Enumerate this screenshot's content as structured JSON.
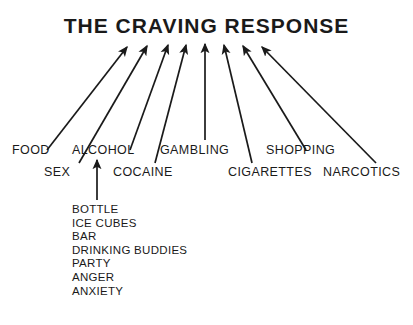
{
  "title": "THE CRAVING RESPONSE",
  "colors": {
    "ink": "#1a1a1a",
    "background": "#ffffff"
  },
  "diagram": {
    "type": "converging-arrow-fan",
    "convergence_point": {
      "x": 205,
      "y": 44
    }
  },
  "triggers": {
    "row_top": [
      {
        "label": "FOOD",
        "x": 12,
        "y": 143
      },
      {
        "label": "ALCOHOL",
        "x": 72,
        "y": 143
      },
      {
        "label": "GAMBLING",
        "x": 160,
        "y": 143
      },
      {
        "label": "SHOPPING",
        "x": 266,
        "y": 143
      }
    ],
    "row_bottom": [
      {
        "label": "SEX",
        "x": 44,
        "y": 165
      },
      {
        "label": "COCAINE",
        "x": 113,
        "y": 165
      },
      {
        "label": "CIGARETTES",
        "x": 228,
        "y": 165
      },
      {
        "label": "NARCOTICS",
        "x": 323,
        "y": 165
      }
    ]
  },
  "arrows": [
    {
      "name": "arrow-food",
      "x1": 47,
      "y1": 150,
      "x2": 127,
      "y2": 47
    },
    {
      "name": "arrow-sex",
      "x1": 79,
      "y1": 163,
      "x2": 147,
      "y2": 46
    },
    {
      "name": "arrow-alcohol",
      "x1": 130,
      "y1": 150,
      "x2": 168,
      "y2": 45
    },
    {
      "name": "arrow-cocaine",
      "x1": 155,
      "y1": 163,
      "x2": 186,
      "y2": 45
    },
    {
      "name": "arrow-gambling",
      "x1": 205,
      "y1": 140,
      "x2": 205,
      "y2": 44
    },
    {
      "name": "arrow-cigarettes",
      "x1": 252,
      "y1": 163,
      "x2": 224,
      "y2": 45
    },
    {
      "name": "arrow-shopping",
      "x1": 306,
      "y1": 150,
      "x2": 243,
      "y2": 46
    },
    {
      "name": "arrow-narcotics",
      "x1": 376,
      "y1": 163,
      "x2": 262,
      "y2": 47
    }
  ],
  "alcohol_cues": {
    "arrow": {
      "name": "arrow-alcohol-cues",
      "x1": 97,
      "y1": 200,
      "x2": 97,
      "y2": 160
    },
    "items": [
      "BOTTLE",
      "ICE CUBES",
      "BAR",
      "DRINKING BUDDIES",
      "PARTY",
      "ANGER",
      "ANXIETY"
    ]
  }
}
